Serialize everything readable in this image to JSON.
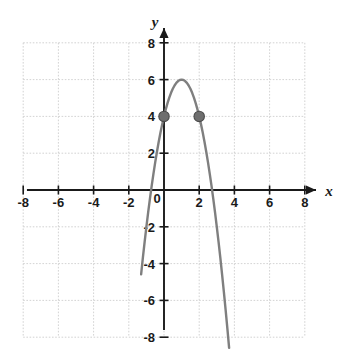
{
  "chart_data": {
    "type": "line",
    "title": "",
    "xlabel": "x",
    "ylabel": "y",
    "xlim": [
      -8,
      8
    ],
    "ylim": [
      -8,
      8
    ],
    "grid": true,
    "grid_step": 2,
    "legend": "none",
    "x_ticks": [
      -8,
      -6,
      -4,
      -2,
      0,
      2,
      4,
      6,
      8
    ],
    "y_ticks": [
      -8,
      -6,
      -4,
      -2,
      2,
      4,
      6,
      8
    ],
    "x_tick_labels": [
      "-8",
      "-6",
      "-4",
      "-2",
      "0",
      "2",
      "4",
      "6",
      "8"
    ],
    "y_tick_labels": [
      "-8",
      "-6",
      "-4",
      "-2",
      "2",
      "4",
      "6",
      "8"
    ],
    "series": [
      {
        "name": "parabola",
        "type": "line",
        "equation": "y = -2(x - 1)^2 + 6",
        "vertex": [
          1,
          6
        ],
        "roots": [
          -0.73,
          2.73
        ],
        "color": "#7f7f7f",
        "x": [
          -1.3,
          -1.2,
          -1.1,
          -1.0,
          -0.9,
          -0.8,
          -0.7,
          -0.6,
          -0.5,
          -0.4,
          -0.3,
          -0.2,
          -0.1,
          0.0,
          0.1,
          0.2,
          0.3,
          0.4,
          0.5,
          0.6,
          0.7,
          0.8,
          0.9,
          1.0,
          1.1,
          1.2,
          1.3,
          1.4,
          1.5,
          1.6,
          1.7,
          1.8,
          1.9,
          2.0,
          2.1,
          2.2,
          2.3,
          2.4,
          2.5,
          2.6,
          2.7,
          2.8,
          2.9,
          3.0,
          3.1,
          3.2,
          3.3,
          3.4,
          3.5,
          3.6,
          3.7
        ],
        "y": [
          -4.58,
          -3.68,
          -2.82,
          -2.0,
          -1.22,
          -0.48,
          0.22,
          0.88,
          1.5,
          2.08,
          2.62,
          3.12,
          3.58,
          4.0,
          4.38,
          4.72,
          5.02,
          5.28,
          5.5,
          5.68,
          5.82,
          5.92,
          5.98,
          6.0,
          5.98,
          5.92,
          5.82,
          5.68,
          5.5,
          5.28,
          5.02,
          4.72,
          4.38,
          4.0,
          3.58,
          3.12,
          2.62,
          2.08,
          1.5,
          0.88,
          0.22,
          -0.48,
          -1.22,
          -2.0,
          -2.82,
          -3.68,
          -4.58,
          -5.52,
          -6.5,
          -7.52,
          -8.58
        ]
      }
    ],
    "points": [
      {
        "label": "point-a",
        "x": 0,
        "y": 4,
        "color": "#6e6e6e"
      },
      {
        "label": "point-b",
        "x": 2,
        "y": 4,
        "color": "#6e6e6e"
      }
    ],
    "colors": {
      "curve": "#7f7f7f",
      "axis": "#1a1a1a",
      "grid": "#c8c8c8",
      "point": "#6e6e6e",
      "point_stroke": "#4a4a4a",
      "background": "#ffffff"
    }
  },
  "axes": {
    "x_axis_label": "x",
    "y_axis_label": "y"
  }
}
